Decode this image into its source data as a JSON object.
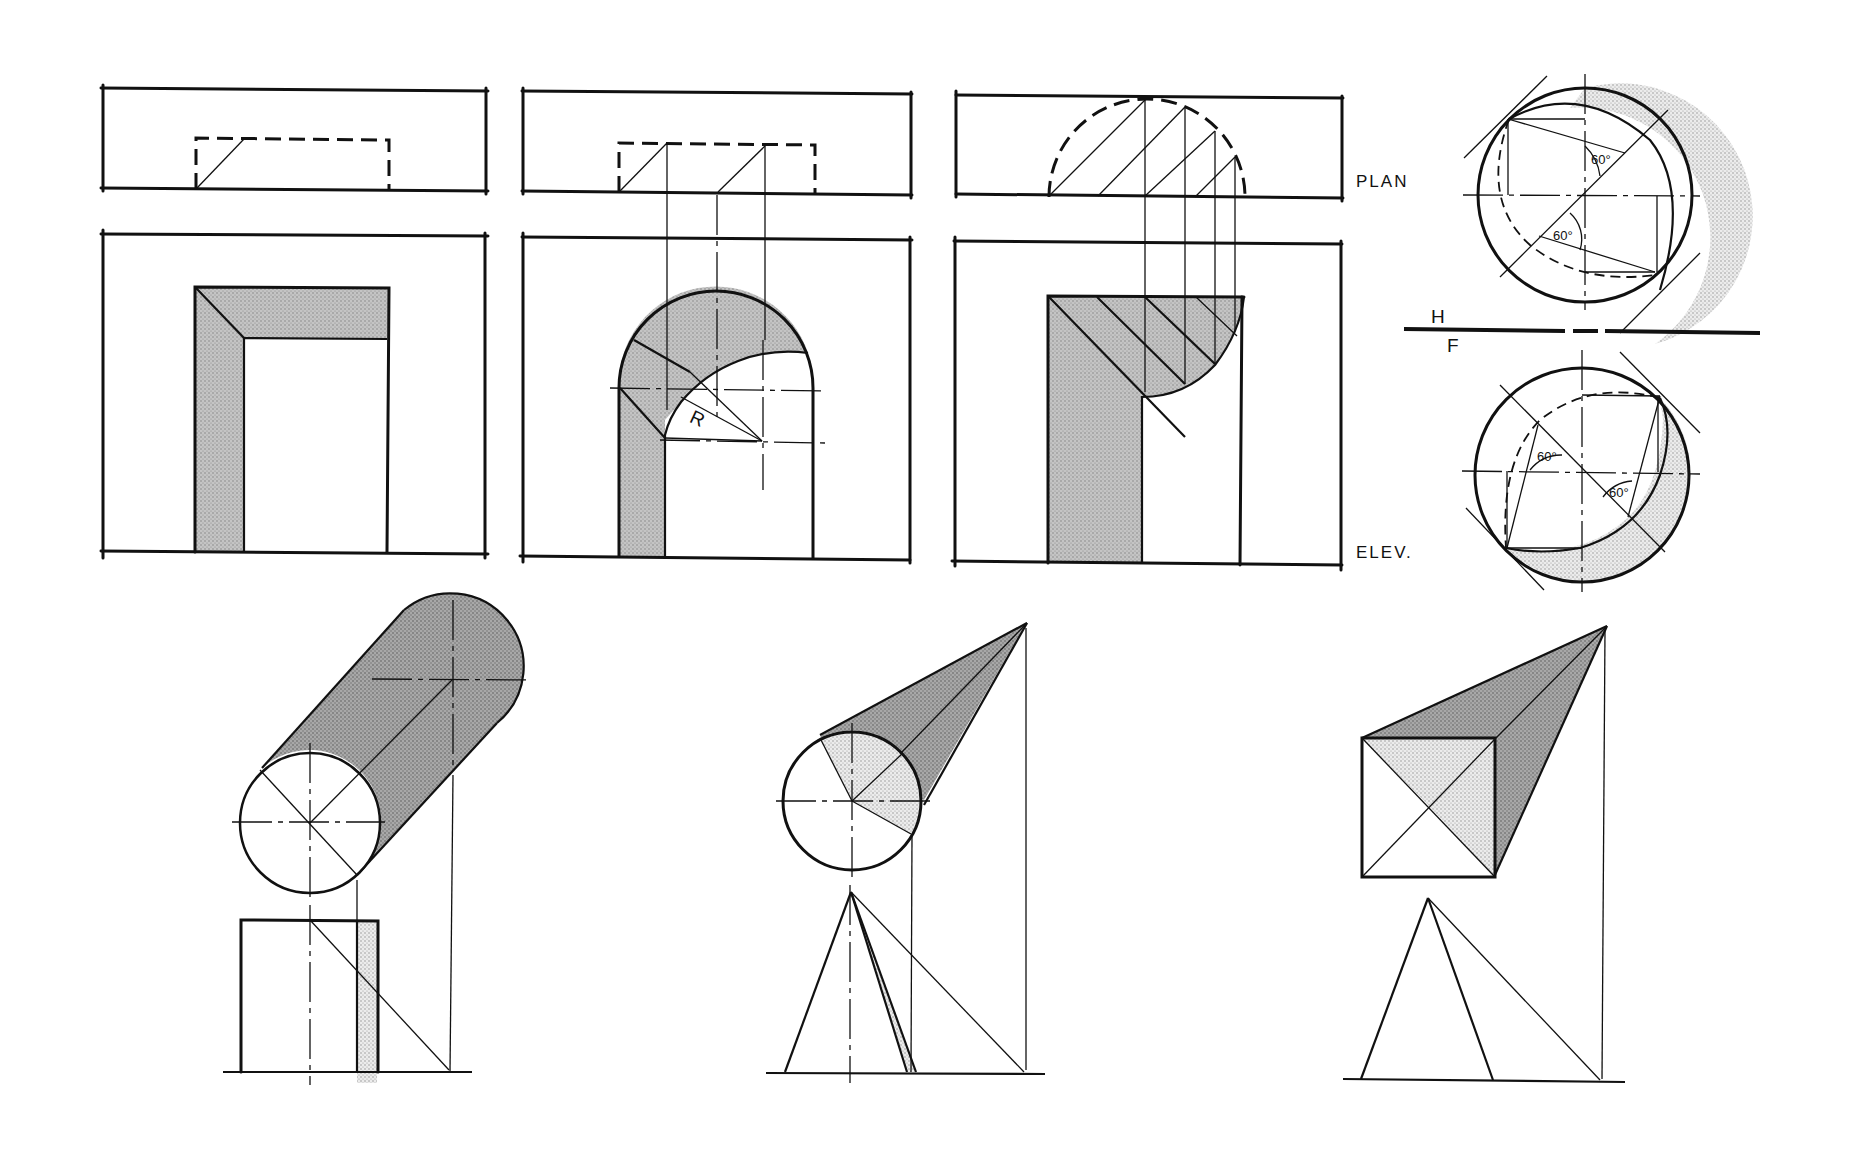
{
  "figure": {
    "type": "technical drawing — shade and shadow constructions (orthographic projection)",
    "colors": {
      "line": "#111111",
      "background": "#ffffff",
      "shade_mid": "#b9b9b9",
      "shade_dark": "#9a9a9a",
      "shade_light": "#d6d6d6"
    }
  },
  "labels": {
    "plan": "PLAN",
    "elev": "ELEV.",
    "h": "H",
    "f": "F",
    "radius": "R",
    "angle_1": "60°",
    "angle_2": "60°",
    "angle_3": "60°",
    "angle_4": "60°"
  },
  "panels": [
    {
      "id": "rectangular-opening",
      "views": [
        "plan",
        "elevation"
      ],
      "description": "Rectangular recessed opening with shadow of head and jamb"
    },
    {
      "id": "arched-opening",
      "views": [
        "plan",
        "elevation"
      ],
      "description": "Semicircular arched opening with shadow construction, radius R"
    },
    {
      "id": "semicircular-niche",
      "views": [
        "plan",
        "elevation"
      ],
      "description": "Semicircular niche with projected shadow lines"
    },
    {
      "id": "sphere",
      "views": [
        "top",
        "front"
      ],
      "description": "Sphere shade line construction with 60° angles, H/F fold line"
    },
    {
      "id": "cylinder",
      "views": [
        "plan",
        "elevation"
      ],
      "description": "Cylinder shadow"
    },
    {
      "id": "cone",
      "views": [
        "plan",
        "elevation"
      ],
      "description": "Cone shadow"
    },
    {
      "id": "pyramid",
      "views": [
        "plan",
        "elevation"
      ],
      "description": "Square pyramid shadow"
    }
  ]
}
